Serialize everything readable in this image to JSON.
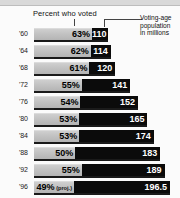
{
  "header": {
    "percent_label": "Percent who voted",
    "population_label": "Voting-age population in millions",
    "population_label_line1": "Voting-age",
    "population_label_line2": "population",
    "population_label_line3": "in millions"
  },
  "chart_data": {
    "type": "bar",
    "title": "",
    "subtitle": "",
    "orientation": "horizontal",
    "xlabel": "",
    "ylabel": "",
    "grid": false,
    "legend_position": "top",
    "categories": [
      "'60",
      "'64",
      "'68",
      "'72",
      "'76",
      "'80",
      "'84",
      "'88",
      "'92",
      "'96"
    ],
    "series": [
      {
        "name": "Percent who voted",
        "unit": "%",
        "values": [
          63,
          62,
          61,
          55,
          54,
          53,
          53,
          50,
          55,
          49
        ],
        "labels": [
          "63%",
          "62%",
          "61%",
          "55%",
          "54%",
          "53%",
          "53%",
          "50%",
          "55%",
          "49%"
        ]
      },
      {
        "name": "Voting-age population in millions",
        "unit": "millions",
        "values": [
          110,
          114,
          120,
          141,
          152,
          165,
          174,
          183,
          189,
          196.5
        ],
        "labels": [
          "110",
          "114",
          "120",
          "141",
          "152",
          "165",
          "174",
          "183",
          "189",
          "196.5"
        ]
      }
    ],
    "annotations": [
      "(proj.)"
    ],
    "rows": [
      {
        "year": "'60",
        "percent": 63,
        "percent_label": "63%",
        "population": 110,
        "population_label": "110",
        "note": ""
      },
      {
        "year": "'64",
        "percent": 62,
        "percent_label": "62%",
        "population": 114,
        "population_label": "114",
        "note": ""
      },
      {
        "year": "'68",
        "percent": 61,
        "percent_label": "61%",
        "population": 120,
        "population_label": "120",
        "note": ""
      },
      {
        "year": "'72",
        "percent": 55,
        "percent_label": "55%",
        "population": 141,
        "population_label": "141",
        "note": ""
      },
      {
        "year": "'76",
        "percent": 54,
        "percent_label": "54%",
        "population": 152,
        "population_label": "152",
        "note": ""
      },
      {
        "year": "'80",
        "percent": 53,
        "percent_label": "53%",
        "population": 165,
        "population_label": "165",
        "note": ""
      },
      {
        "year": "'84",
        "percent": 53,
        "percent_label": "53%",
        "population": 174,
        "population_label": "174",
        "note": ""
      },
      {
        "year": "'88",
        "percent": 50,
        "percent_label": "50%",
        "population": 183,
        "population_label": "183",
        "note": ""
      },
      {
        "year": "'92",
        "percent": 55,
        "percent_label": "55%",
        "population": 189,
        "population_label": "189",
        "note": ""
      },
      {
        "year": "'96",
        "percent": 49,
        "percent_label": "49%",
        "population": 196.5,
        "population_label": "196.5",
        "note": "(proj.)"
      }
    ]
  },
  "colors": {
    "percent_bar": "#c2c2c2",
    "population_bar": "#0b0b0b",
    "background": "#fbfbfb",
    "text": "#111111"
  }
}
